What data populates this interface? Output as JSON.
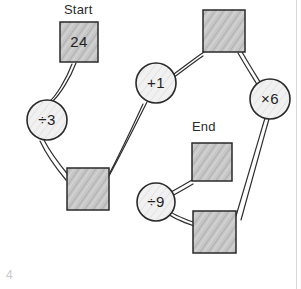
{
  "diagram": {
    "title_labels": [
      {
        "name": "start-label",
        "text": "Start",
        "x": 64,
        "y": 4
      },
      {
        "name": "end-label",
        "text": "End",
        "x": 192,
        "y": 121
      }
    ],
    "box_nodes": [
      {
        "id": "box-start",
        "label": "24",
        "x": 60,
        "y": 22,
        "w": 38,
        "h": 40
      },
      {
        "id": "box-lower-left",
        "label": "",
        "x": 67,
        "y": 168,
        "w": 42,
        "h": 42
      },
      {
        "id": "box-upper-right",
        "label": "",
        "x": 203,
        "y": 10,
        "w": 42,
        "h": 42
      },
      {
        "id": "box-end",
        "label": "",
        "x": 192,
        "y": 143,
        "w": 40,
        "h": 38
      },
      {
        "id": "box-lower-right",
        "label": "",
        "x": 193,
        "y": 211,
        "w": 43,
        "h": 42
      }
    ],
    "op_nodes": [
      {
        "id": "op-div3",
        "label": "÷3",
        "cx": 47,
        "cy": 120,
        "r": 20
      },
      {
        "id": "op-plus1",
        "label": "+1",
        "cx": 156,
        "cy": 83,
        "r": 20
      },
      {
        "id": "op-mul6",
        "label": "×6",
        "cx": 270,
        "cy": 99,
        "r": 20
      },
      {
        "id": "op-div9",
        "label": "÷9",
        "cx": 156,
        "cy": 202,
        "r": 19
      }
    ],
    "edges": [
      {
        "id": "edge-start-div3",
        "from": "box-start",
        "to": "op-div3"
      },
      {
        "id": "edge-div3-lowerleft",
        "from": "op-div3",
        "to": "box-lower-left"
      },
      {
        "id": "edge-lowerleft-plus1",
        "from": "box-lower-left",
        "to": "op-plus1"
      },
      {
        "id": "edge-plus1-upperright",
        "from": "op-plus1",
        "to": "box-upper-right"
      },
      {
        "id": "edge-upperright-mul6",
        "from": "box-upper-right",
        "to": "op-mul6"
      },
      {
        "id": "edge-mul6-lowerright",
        "from": "op-mul6",
        "to": "box-lower-right"
      },
      {
        "id": "edge-lowerright-div9",
        "from": "box-lower-right",
        "to": "op-div9"
      },
      {
        "id": "edge-div9-end",
        "from": "op-div9",
        "to": "box-end"
      }
    ],
    "corner_number": "4",
    "colors": {
      "ink": "#2a2a2a",
      "box_fill": "#c8c8c8",
      "circle_fill": "#f0f0f0",
      "background": "#ffffff",
      "border_line": "#d8d8d8",
      "corner_number": "#c9c9c9"
    }
  }
}
